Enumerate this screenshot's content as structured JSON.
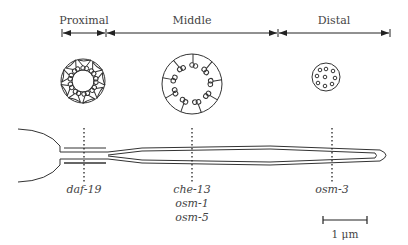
{
  "regions": [
    {
      "label": "Proximal",
      "x1": 62,
      "x2": 106
    },
    {
      "label": "Middle",
      "x1": 106,
      "x2": 278
    },
    {
      "label": "Distal",
      "x1": 278,
      "x2": 390
    }
  ],
  "cross_sections": {
    "proximal": {
      "description": "doublet microtubules with transition fibers"
    },
    "middle": {
      "description": "doublet microtubules with radial links",
      "count": 9
    },
    "distal": {
      "description": "singlet microtubules",
      "count": 10
    }
  },
  "gene_markers": [
    {
      "x": 84,
      "genes": [
        "daf-19"
      ]
    },
    {
      "x": 192,
      "genes": [
        "che-13",
        "osm-1",
        "osm-5"
      ]
    },
    {
      "x": 332,
      "genes": [
        "osm-3"
      ]
    }
  ],
  "scale_bar": {
    "label": "1 μm"
  },
  "colors": {
    "line": "#333333",
    "text": "#444444",
    "background": "#ffffff"
  }
}
